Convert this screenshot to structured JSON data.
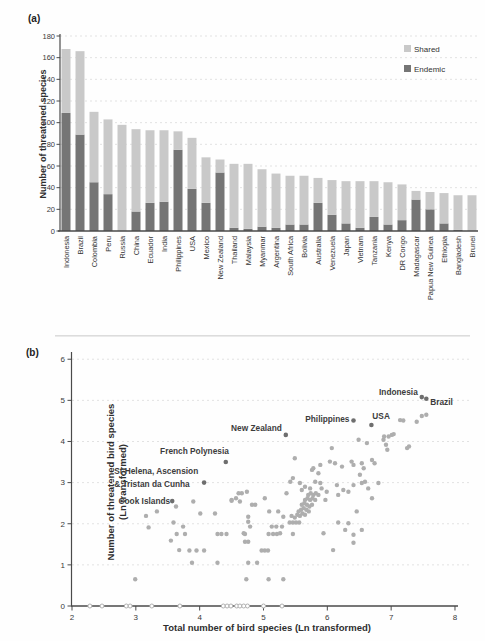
{
  "panels": {
    "a": {
      "letter": "(a)"
    },
    "b": {
      "letter": "(b)"
    }
  },
  "colors": {
    "shared": "#c9c9c9",
    "endemic": "#757575",
    "scatter_point": "#aeaeae",
    "labeled_point": "#6e6e6e",
    "grid": "#e2e2e2",
    "axis": "#4a4a4a"
  },
  "chart_data": [
    {
      "type": "bar",
      "stacked": true,
      "ylabel": "Number of threatened species",
      "ylim": [
        0,
        180
      ],
      "ytick_step": 20,
      "grid": true,
      "legend_position": "top-right",
      "legend": [
        {
          "label": "Shared",
          "color": "#c9c9c9"
        },
        {
          "label": "Endemic",
          "color": "#757575"
        }
      ],
      "categories": [
        "Indonesia",
        "Brazil",
        "Colombia",
        "Peru",
        "Russia",
        "China",
        "Ecuador",
        "India",
        "Philippines",
        "USA",
        "Mexico",
        "New Zealand",
        "Thailand",
        "Malaysia",
        "Myanmar",
        "Argentina",
        "South Africa",
        "Bolivia",
        "Australia",
        "Venezuela",
        "Japan",
        "Vietnam",
        "Tanzania",
        "Kenya",
        "DR Congo",
        "Madagascar",
        "Papua New Guinea",
        "Ethiopia",
        "Bangladesh",
        "Brunei"
      ],
      "series": [
        {
          "name": "Endemic",
          "color": "#757575",
          "values": [
            109,
            89,
            45,
            34,
            0,
            18,
            26,
            27,
            75,
            39,
            26,
            54,
            3,
            2,
            4,
            3,
            6,
            6,
            26,
            15,
            7,
            3,
            13,
            6,
            10,
            29,
            20,
            7,
            1,
            0
          ]
        },
        {
          "name": "Shared",
          "color": "#c9c9c9",
          "values": [
            59,
            77,
            65,
            69,
            98,
            76,
            67,
            66,
            17,
            47,
            42,
            12,
            59,
            60,
            53,
            50,
            45,
            45,
            23,
            32,
            39,
            43,
            33,
            39,
            33,
            8,
            16,
            28,
            32,
            33
          ]
        }
      ],
      "totals": [
        168,
        166,
        110,
        103,
        98,
        94,
        93,
        93,
        92,
        86,
        68,
        66,
        62,
        62,
        57,
        53,
        51,
        51,
        49,
        47,
        46,
        46,
        46,
        45,
        43,
        37,
        36,
        35,
        33,
        33
      ]
    },
    {
      "type": "scatter",
      "xlabel": "Total number of bird species (Ln transformed)",
      "ylabel_line1": "Number of threatened bird species",
      "ylabel_line2": "(Ln transformed)",
      "xlim": [
        2,
        8
      ],
      "ylim": [
        0,
        6
      ],
      "xtick_step": 1,
      "ytick_step": 1,
      "grid": true,
      "labeled_points": [
        {
          "label": "Indonesia",
          "x": 7.48,
          "y": 5.08,
          "label_side": "left"
        },
        {
          "label": "Brazil",
          "x": 7.55,
          "y": 5.04,
          "label_side": "right-below"
        },
        {
          "label": "USA",
          "x": 6.69,
          "y": 4.4,
          "label_side": "above-right"
        },
        {
          "label": "Philippines",
          "x": 6.41,
          "y": 4.51,
          "label_side": "left"
        },
        {
          "label": "New Zealand",
          "x": 5.35,
          "y": 4.16,
          "label_side": "left-above"
        },
        {
          "label": "French Polynesia",
          "x": 4.41,
          "y": 3.5,
          "label_side": "above-left"
        },
        {
          "label": "St Helena, Ascension & Tristan da Cunha",
          "label_line1": "St Helena, Ascension",
          "label_line2": "& Tristan da Cunha",
          "x": 4.07,
          "y": 3.0,
          "label_side": "two-line-left"
        },
        {
          "label": "Cook Islands",
          "x": 3.57,
          "y": 2.55,
          "label_side": "left-below"
        }
      ],
      "points": [
        [
          2.99,
          0.65
        ],
        [
          3.2,
          1.91
        ],
        [
          3.16,
          2.19
        ],
        [
          3.33,
          2.3
        ],
        [
          3.63,
          2.42
        ],
        [
          3.59,
          2.03
        ],
        [
          3.74,
          1.93
        ],
        [
          3.64,
          1.75
        ],
        [
          3.77,
          1.75
        ],
        [
          3.55,
          1.59
        ],
        [
          3.68,
          1.36
        ],
        [
          3.84,
          1.35
        ],
        [
          3.95,
          1.35
        ],
        [
          4.07,
          1.35
        ],
        [
          3.88,
          1.05
        ],
        [
          4.28,
          1.05
        ],
        [
          3.9,
          2.54
        ],
        [
          4.01,
          2.25
        ],
        [
          4.24,
          2.25
        ],
        [
          4.28,
          1.75
        ],
        [
          4.34,
          1.75
        ],
        [
          4.42,
          1.75
        ],
        [
          4.5,
          2.56
        ],
        [
          4.57,
          2.62
        ],
        [
          4.73,
          0.65
        ],
        [
          4.76,
          1.05
        ],
        [
          4.9,
          1.05
        ],
        [
          4.76,
          1.56
        ],
        [
          4.71,
          1.75
        ],
        [
          4.76,
          2.05
        ],
        [
          4.97,
          1.35
        ],
        [
          5.02,
          1.35
        ],
        [
          5.07,
          1.35
        ],
        [
          5.08,
          0.65
        ],
        [
          5.31,
          0.65
        ],
        [
          5.08,
          1.75
        ],
        [
          5.15,
          1.75
        ],
        [
          5.21,
          1.75
        ],
        [
          5.26,
          1.77
        ],
        [
          5.46,
          1.75
        ],
        [
          5.13,
          1.93
        ],
        [
          5.2,
          1.93
        ],
        [
          5.29,
          1.93
        ],
        [
          4.79,
          1.93
        ],
        [
          4.69,
          1.77
        ],
        [
          4.71,
          1.56
        ],
        [
          4.61,
          2.74
        ],
        [
          4.63,
          2.54
        ],
        [
          4.82,
          2.46
        ],
        [
          4.5,
          2.58
        ],
        [
          5.09,
          2.3
        ],
        [
          5.23,
          2.3
        ],
        [
          5.31,
          2.17
        ],
        [
          4.76,
          2.17
        ],
        [
          4.66,
          2.74
        ],
        [
          4.74,
          2.78
        ],
        [
          4.87,
          2.46
        ],
        [
          5.02,
          2.62
        ],
        [
          5.41,
          2.03
        ],
        [
          5.46,
          2.03
        ],
        [
          5.51,
          2.03
        ],
        [
          5.56,
          2.03
        ],
        [
          5.44,
          2.19
        ],
        [
          5.49,
          2.15
        ],
        [
          5.53,
          2.22
        ],
        [
          5.57,
          2.19
        ],
        [
          5.61,
          2.25
        ],
        [
          5.65,
          2.22
        ],
        [
          5.55,
          2.3
        ],
        [
          5.59,
          2.34
        ],
        [
          5.63,
          2.38
        ],
        [
          5.67,
          2.34
        ],
        [
          5.71,
          2.3
        ],
        [
          5.6,
          2.46
        ],
        [
          5.64,
          2.5
        ],
        [
          5.68,
          2.46
        ],
        [
          5.72,
          2.42
        ],
        [
          5.76,
          2.46
        ],
        [
          5.65,
          2.58
        ],
        [
          5.69,
          2.62
        ],
        [
          5.73,
          2.58
        ],
        [
          5.77,
          2.62
        ],
        [
          5.81,
          2.58
        ],
        [
          5.7,
          2.7
        ],
        [
          5.74,
          2.74
        ],
        [
          5.78,
          2.7
        ],
        [
          5.82,
          2.74
        ],
        [
          5.86,
          2.7
        ],
        [
          5.57,
          2.99
        ],
        [
          5.65,
          2.9
        ],
        [
          5.73,
          2.86
        ],
        [
          5.81,
          3.02
        ],
        [
          5.89,
          2.99
        ],
        [
          5.91,
          2.86
        ],
        [
          5.99,
          2.78
        ],
        [
          5.97,
          2.58
        ],
        [
          5.94,
          1.77
        ],
        [
          5.46,
          3.11
        ],
        [
          5.49,
          3.59
        ],
        [
          5.42,
          3.02
        ],
        [
          5.36,
          2.74
        ],
        [
          5.6,
          2.82
        ],
        [
          5.78,
          3.35
        ],
        [
          5.86,
          3.23
        ],
        [
          6.09,
          1.36
        ],
        [
          6.17,
          2.03
        ],
        [
          6.28,
          1.85
        ],
        [
          6.41,
          1.73
        ],
        [
          6.41,
          1.54
        ],
        [
          6.54,
          1.85
        ],
        [
          6.33,
          2.01
        ],
        [
          6.07,
          3.84
        ],
        [
          6.04,
          3.51
        ],
        [
          6.12,
          3.47
        ],
        [
          6.15,
          2.94
        ],
        [
          6.17,
          2.7
        ],
        [
          6.23,
          3.39
        ],
        [
          6.25,
          2.82
        ],
        [
          6.33,
          2.78
        ],
        [
          6.38,
          3.51
        ],
        [
          6.41,
          2.94
        ],
        [
          6.41,
          3.43
        ],
        [
          6.49,
          4.04
        ],
        [
          6.51,
          3.19
        ],
        [
          6.54,
          2.99
        ],
        [
          6.54,
          3.47
        ],
        [
          6.57,
          3.35
        ],
        [
          6.59,
          3.02
        ],
        [
          6.62,
          3.96
        ],
        [
          6.64,
          2.86
        ],
        [
          6.7,
          3.55
        ],
        [
          6.7,
          2.62
        ],
        [
          6.74,
          3.47
        ],
        [
          6.8,
          2.99
        ],
        [
          6.88,
          4.04
        ],
        [
          6.89,
          4.12
        ],
        [
          6.92,
          3.92
        ],
        [
          6.94,
          3.8
        ],
        [
          6.96,
          4.12
        ],
        [
          7.01,
          4.16
        ],
        [
          7.04,
          4.18
        ],
        [
          7.14,
          4.52
        ],
        [
          7.19,
          4.51
        ],
        [
          7.25,
          3.84
        ],
        [
          7.28,
          3.88
        ],
        [
          7.4,
          4.48
        ],
        [
          7.48,
          4.62
        ],
        [
          7.55,
          4.65
        ],
        [
          5.76,
          3.31
        ],
        [
          5.89,
          3.43
        ],
        [
          6.46,
          2.3
        ]
      ],
      "zero_points": [
        2.28,
        2.47,
        2.85,
        2.91,
        3.25,
        3.69,
        4.37,
        4.43,
        4.49,
        4.58,
        4.63,
        4.69,
        4.75,
        5.0,
        5.29
      ]
    }
  ]
}
